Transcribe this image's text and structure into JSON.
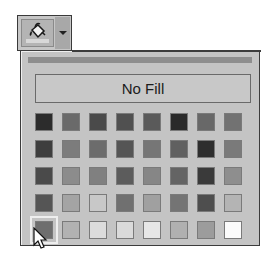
{
  "toolbar": {
    "fill_button": {
      "icon": "paint-bucket-icon",
      "tooltip": ""
    },
    "dropdown": {
      "icon": "chevron-down-icon"
    }
  },
  "panel": {
    "no_fill_label": "No Fill",
    "swatches": [
      [
        "#2c2c2c",
        "#6a6a6a",
        "#4a4a4a",
        "#505050",
        "#5a5a5a",
        "#2a2a2a",
        "#686868",
        "#727272"
      ],
      [
        "#3e3e3e",
        "#7c7c7c",
        "#6c6c6c",
        "#555555",
        "#767676",
        "#606060",
        "#2e2e2e",
        "#7a7a7a"
      ],
      [
        "#4a4a4a",
        "#8c8c8c",
        "#808080",
        "#5c5c5c",
        "#868686",
        "#646464",
        "#3a3a3a",
        "#8e8e8e"
      ],
      [
        "#555555",
        "#a4a4a4",
        "#c8c8c8",
        "#707070",
        "#a0a0a0",
        "#747474",
        "#4e4e4e",
        "#b4b4b4"
      ],
      [
        "#6e6e6e",
        "#b2b2b2",
        "#dcdcdc",
        "#dadada",
        "#e6e6e6",
        "#b0b0b0",
        "#9c9c9c",
        "#fbfbfb"
      ]
    ],
    "selected_swatch": {
      "row": 4,
      "col": 0
    }
  },
  "cursor": {
    "icon": "arrow-cursor-icon"
  }
}
